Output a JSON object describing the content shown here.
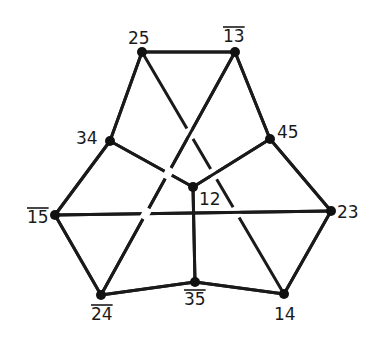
{
  "diagram": {
    "type": "graph",
    "nodes": [
      {
        "id": "25",
        "label": "25",
        "overline": false,
        "x": 142,
        "y": 52,
        "lx": 128,
        "ly": 44
      },
      {
        "id": "13",
        "label": "13",
        "overline": true,
        "x": 235,
        "y": 52,
        "lx": 223,
        "ly": 42
      },
      {
        "id": "34",
        "label": "34",
        "overline": false,
        "x": 110,
        "y": 141,
        "lx": 76,
        "ly": 144
      },
      {
        "id": "45",
        "label": "45",
        "overline": false,
        "x": 270,
        "y": 139,
        "lx": 277,
        "ly": 138
      },
      {
        "id": "12",
        "label": "12",
        "overline": false,
        "x": 193,
        "y": 187,
        "lx": 199,
        "ly": 205
      },
      {
        "id": "15",
        "label": "15",
        "overline": true,
        "x": 55,
        "y": 215,
        "lx": 27,
        "ly": 223
      },
      {
        "id": "23",
        "label": "23",
        "overline": false,
        "x": 331,
        "y": 211,
        "lx": 337,
        "ly": 218
      },
      {
        "id": "24",
        "label": "24",
        "overline": true,
        "x": 101,
        "y": 295,
        "lx": 91,
        "ly": 320
      },
      {
        "id": "35",
        "label": "35",
        "overline": true,
        "x": 195,
        "y": 282,
        "lx": 184,
        "ly": 305
      },
      {
        "id": "14",
        "label": "14",
        "overline": false,
        "x": 284,
        "y": 294,
        "lx": 274,
        "ly": 320
      }
    ],
    "edges": [
      [
        "25",
        "13"
      ],
      [
        "25",
        "34"
      ],
      [
        "13",
        "45"
      ],
      [
        "34",
        "12"
      ],
      [
        "45",
        "12"
      ],
      [
        "34",
        "15"
      ],
      [
        "45",
        "23"
      ],
      [
        "15",
        "23"
      ],
      [
        "12",
        "35"
      ],
      [
        "15",
        "24"
      ],
      [
        "23",
        "14"
      ],
      [
        "24",
        "35"
      ],
      [
        "35",
        "14"
      ],
      [
        "25",
        "14"
      ],
      [
        "13",
        "24"
      ]
    ]
  }
}
